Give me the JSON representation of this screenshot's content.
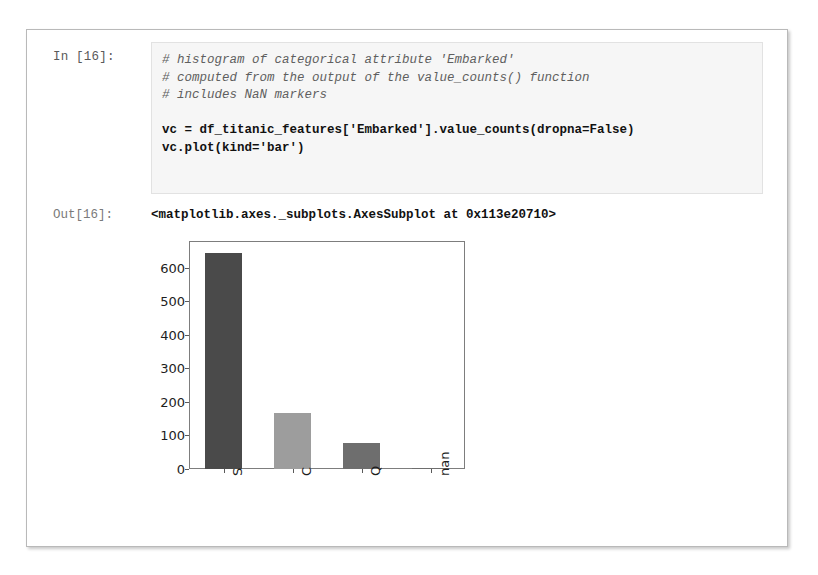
{
  "notebook": {
    "input": {
      "prompt": "In [16]:",
      "lines": [
        {
          "type": "comment",
          "text": "# histogram of categorical attribute 'Embarked'"
        },
        {
          "type": "comment",
          "text": "# computed from the output of the value_counts() function"
        },
        {
          "type": "comment",
          "text": "# includes NaN markers"
        },
        {
          "type": "blank",
          "text": ""
        },
        {
          "type": "code",
          "text": "vc = df_titanic_features['Embarked'].value_counts(dropna=False)"
        },
        {
          "type": "code",
          "text": "vc.plot(kind='bar')"
        }
      ]
    },
    "output": {
      "prompt": "Out[16]:",
      "repr": "<matplotlib.axes._subplots.AxesSubplot at 0x113e20710>"
    }
  },
  "chart_data": {
    "type": "bar",
    "title": "",
    "xlabel": "",
    "ylabel": "",
    "categories": [
      "S",
      "C",
      "Q",
      "nan"
    ],
    "values": [
      644,
      168,
      77,
      2
    ],
    "yticks": [
      0,
      100,
      200,
      300,
      400,
      500,
      600
    ],
    "ylim": [
      0,
      680
    ],
    "grid": false,
    "legend": false,
    "bar_colors": [
      "#4a4a4a",
      "#9d9d9d",
      "#6e6e6e",
      "#6e6e6e"
    ],
    "frame_color": "#7d7d7d",
    "tick_rotation": 90
  }
}
